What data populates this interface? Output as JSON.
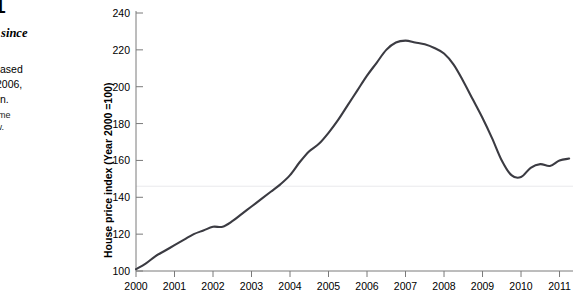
{
  "figure": {
    "number": "1",
    "title": "Prices since",
    "body_lines": [
      "ces increased",
      "2000 to 2006,",
      "since then."
    ],
    "source_lines": [
      "iller Home",
      "p://www.",
      "s.com/",
      "us"
    ]
  },
  "chart_data": {
    "type": "line",
    "title": "",
    "xlabel": "",
    "ylabel": "House price index (Year 2000 =100)",
    "xlim": [
      2000,
      2011.35
    ],
    "ylim": [
      100,
      240
    ],
    "ytick_labels": [
      "100",
      "120",
      "140",
      "160",
      "180",
      "200",
      "220",
      "240"
    ],
    "yticks": [
      100,
      120,
      140,
      160,
      180,
      200,
      220,
      240
    ],
    "xtick_labels": [
      "2000",
      "2001",
      "2002",
      "2003",
      "2004",
      "2005",
      "2006",
      "2007",
      "2008",
      "2009",
      "2010",
      "2011"
    ],
    "xticks": [
      2000,
      2001,
      2002,
      2003,
      2004,
      2005,
      2006,
      2007,
      2008,
      2009,
      2010,
      2011
    ],
    "grid": "faint horizontal gridline near 146",
    "gridlines_y": [
      146
    ],
    "legend": "none",
    "series": [
      {
        "name": "House price index",
        "color": "#3b3b42",
        "x": [
          2000.0,
          2000.25,
          2000.5,
          2000.75,
          2001.0,
          2001.25,
          2001.5,
          2001.75,
          2002.0,
          2002.25,
          2002.5,
          2002.75,
          2003.0,
          2003.25,
          2003.5,
          2003.75,
          2004.0,
          2004.25,
          2004.5,
          2004.75,
          2005.0,
          2005.25,
          2005.5,
          2005.75,
          2006.0,
          2006.25,
          2006.5,
          2006.75,
          2007.0,
          2007.25,
          2007.5,
          2007.75,
          2008.0,
          2008.25,
          2008.5,
          2008.75,
          2009.0,
          2009.25,
          2009.5,
          2009.75,
          2010.0,
          2010.25,
          2010.5,
          2010.75,
          2011.0,
          2011.25
        ],
        "values": [
          101,
          104,
          108,
          111,
          114,
          117,
          120,
          122,
          124,
          124,
          127,
          131,
          135,
          139,
          143,
          147,
          152,
          159,
          165,
          169,
          175,
          182,
          190,
          198,
          206,
          213,
          220,
          224,
          225,
          224,
          223,
          221,
          218,
          212,
          203,
          193,
          183,
          172,
          160,
          152,
          151,
          156,
          158,
          157,
          160,
          161
        ]
      }
    ],
    "annotations": [
      {
        "label": "start 2000",
        "x": 2000,
        "y": 101
      },
      {
        "label": "peak 2006",
        "x": 2006.75,
        "y": 225
      },
      {
        "label": "trough 2009",
        "x": 2009.8,
        "y": 151
      },
      {
        "label": "end 2011",
        "x": 2011.35,
        "y": 152
      }
    ]
  }
}
